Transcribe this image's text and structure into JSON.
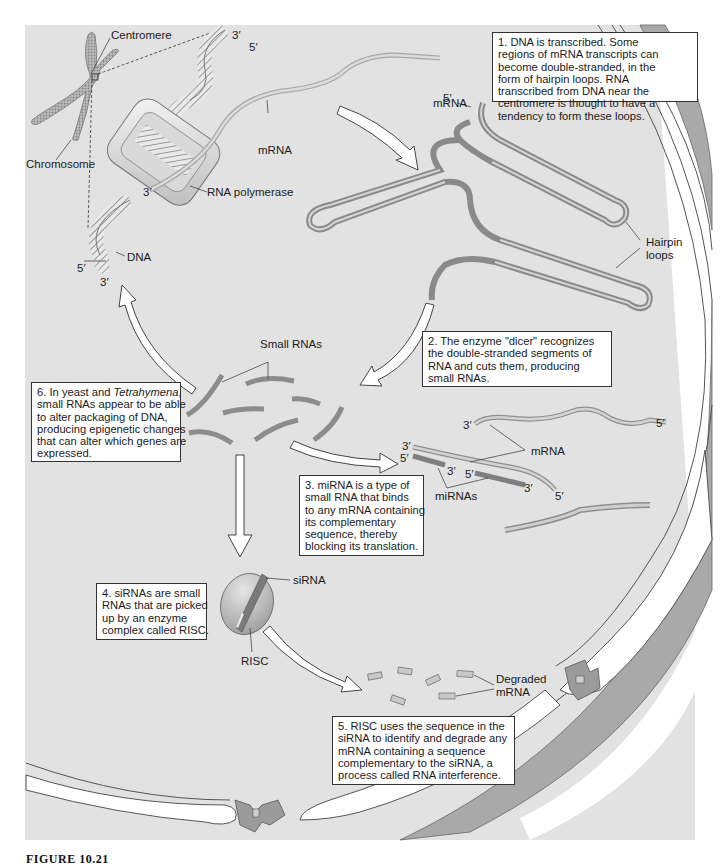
{
  "figure": {
    "caption": "FIGURE 10.21",
    "colors": {
      "cell_background": "#e2e2e2",
      "page_background": "#ffffff",
      "membrane_dark": "#a9a9a9",
      "membrane_light": "#ffffff",
      "rna_strand": "#c4c4c4",
      "small_rna": "#8c8c8c",
      "box_border": "#333333"
    }
  },
  "labels": {
    "centromere": "Centromere",
    "chromosome": "Chromosome",
    "mrna_top": "mRNA",
    "rna_polymerase": "RNA polymerase",
    "dna": "DNA",
    "mrna_hairpin": "mRNA",
    "hairpin_loops_1": "Hairpin",
    "hairpin_loops_2": "loops",
    "small_rnas": "Small RNAs",
    "mrna_mirna": "mRNA",
    "mirnas": "miRNAs",
    "sirna": "siRNA",
    "risc": "RISC",
    "degraded_1": "Degraded",
    "degraded_2": "mRNA"
  },
  "primes": {
    "dna_top_3": "3′",
    "dna_top_5": "5′",
    "mrna_5": "5′",
    "pol_3": "3′",
    "dna_bot_5": "5′",
    "dna_bot_3": "3′",
    "mir_top_3": "3′",
    "mir_top_5": "5′",
    "mir_left_3": "3′",
    "mir_left_5": "5′",
    "mir_a_3": "3′",
    "mir_b_5": "5′",
    "mir_b_3": "3′",
    "mir_end_5": "5′"
  },
  "steps": [
    {
      "number": "1.",
      "lines": [
        "1. DNA is transcribed. Some",
        "regions of mRNA transcripts can",
        "become double-stranded, in the",
        "form of hairpin loops. RNA",
        "transcribed from DNA near the",
        "centromere is thought to have a",
        "tendency to form these loops."
      ]
    },
    {
      "number": "2.",
      "lines": [
        "2. The enzyme \"dicer\" recognizes",
        "the double-stranded segments of",
        "RNA and cuts them, producing",
        "small RNAs."
      ]
    },
    {
      "number": "3.",
      "lines": [
        "3. miRNA is a type of",
        "small RNA that binds",
        "to any mRNA containing",
        "its complementary",
        "sequence, thereby",
        "blocking its translation."
      ]
    },
    {
      "number": "4.",
      "lines": [
        "4. siRNAs are small",
        "RNAs that are picked",
        "up by an enzyme",
        "complex called RISC."
      ]
    },
    {
      "number": "5.",
      "lines": [
        "5. RISC uses the sequence in the",
        "siRNA to identify and degrade any",
        "mRNA containing a sequence",
        "complementary to the siRNA, a",
        "process called RNA interference."
      ]
    },
    {
      "number": "6.",
      "line1_prefix": "6. In yeast and ",
      "line1_italic": "Tetrahymena",
      "line1_suffix": ",",
      "lines": [
        "6. In yeast and Tetrahymena,",
        "small RNAs appear to be able",
        "to alter packaging of DNA,",
        "producing epigenetic changes",
        "that can alter which genes are",
        "expressed."
      ]
    }
  ]
}
